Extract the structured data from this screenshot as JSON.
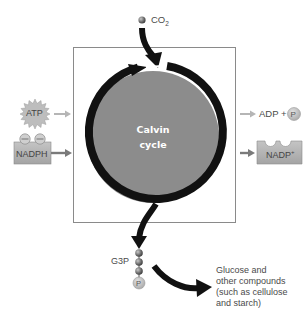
{
  "diagram": {
    "title": "Calvin cycle",
    "center_label_line1": "Calvin",
    "center_label_line2": "cycle",
    "inputs": {
      "co2": {
        "label": "CO",
        "subscript": "2"
      },
      "atp": {
        "label": "ATP"
      },
      "nadph": {
        "label": "NADPH"
      }
    },
    "outputs": {
      "adp": {
        "label": "ADP +",
        "phosphate": "P"
      },
      "nadp": {
        "label": "NADP",
        "superscript": "+"
      },
      "g3p": {
        "label": "G3P",
        "phosphate": "P"
      },
      "glucose": {
        "lines": [
          "Glucose and",
          "other compounds",
          "(such as cellulose",
          "and starch)"
        ]
      }
    },
    "colors": {
      "cycle_fill": "#8c8c8c",
      "arrow": "#111111",
      "box_border": "#8a8a8a",
      "molecule_gray": "#b9b9b9",
      "input_arrow": "#b0b0b0",
      "dark_arrow": "#7a7a7a"
    }
  }
}
